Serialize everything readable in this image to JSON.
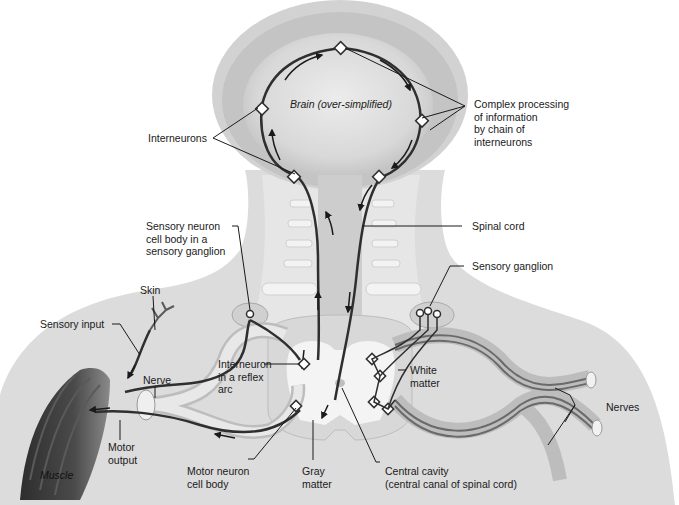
{
  "diagram": {
    "type": "anatomical-illustration",
    "colors": {
      "background": "#ffffff",
      "body": "#d9d9d9",
      "body_light": "#ebebeb",
      "brain_outer": "#c8c8c8",
      "brain_inner": "#e4e4e4",
      "nerve_fill": "#cfcfcf",
      "neuron_line": "#3a3a3a",
      "muscle": "#3c3c3c"
    }
  },
  "labels": {
    "brain": "Brain (over-simplified)",
    "interneurons": "Interneurons",
    "complex_processing": "Complex processing\nof information\nby chain of\ninterneurons",
    "spinal_cord": "Spinal cord",
    "sensory_neuron_cell_body": "Sensory neuron\ncell body in a\nsensory ganglion",
    "sensory_ganglion": "Sensory ganglion",
    "skin": "Skin",
    "sensory_input": "Sensory input",
    "nerve": "Nerve",
    "interneuron_reflex_arc": "Interneuron\nin a reflex\narc",
    "white_matter": "White\nmatter",
    "nerves": "Nerves",
    "motor_output": "Motor\noutput",
    "muscle": "Muscle",
    "motor_neuron_cell_body": "Motor neuron\ncell body",
    "gray_matter": "Gray\nmatter",
    "central_cavity": "Central cavity\n(central canal of spinal cord)"
  }
}
